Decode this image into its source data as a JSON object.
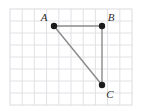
{
  "figure": {
    "name": "triangle-on-grid",
    "canvas": {
      "width": 142,
      "height": 111,
      "background": "#ffffff"
    },
    "grid": {
      "left": 10,
      "top": 9,
      "right": 132,
      "bottom": 105,
      "columns": 10,
      "rows": 8,
      "cell_width": 12.2,
      "cell_height": 12.0,
      "line_color": "#e2e2e6",
      "border_color": "#dcdce0",
      "visible": true
    },
    "style": {
      "segment_color": "#8a8a8a",
      "segment_width": 1.4,
      "vertex_fill": "#1a1a1a",
      "vertex_radius": 3.2,
      "label_color": "#2b2b2b"
    },
    "vertices": [
      {
        "id": "A",
        "label": "A",
        "x": 54,
        "y": 26,
        "grid_col": 3.6,
        "grid_row": 1.4,
        "label_dx": -10,
        "label_dy": -5,
        "label_anchor": "middle"
      },
      {
        "id": "B",
        "label": "B",
        "x": 102,
        "y": 26,
        "grid_col": 7.5,
        "grid_row": 1.4,
        "label_dx": 9,
        "label_dy": -5,
        "label_anchor": "middle"
      },
      {
        "id": "C",
        "label": "C",
        "x": 102,
        "y": 85,
        "grid_col": 7.5,
        "grid_row": 6.3,
        "label_dx": 8,
        "label_dy": 13,
        "label_anchor": "middle"
      }
    ],
    "segments": [
      {
        "id": "AB",
        "from": "A",
        "to": "B"
      },
      {
        "id": "BC",
        "from": "B",
        "to": "C"
      },
      {
        "id": "CA",
        "from": "C",
        "to": "A"
      }
    ]
  }
}
